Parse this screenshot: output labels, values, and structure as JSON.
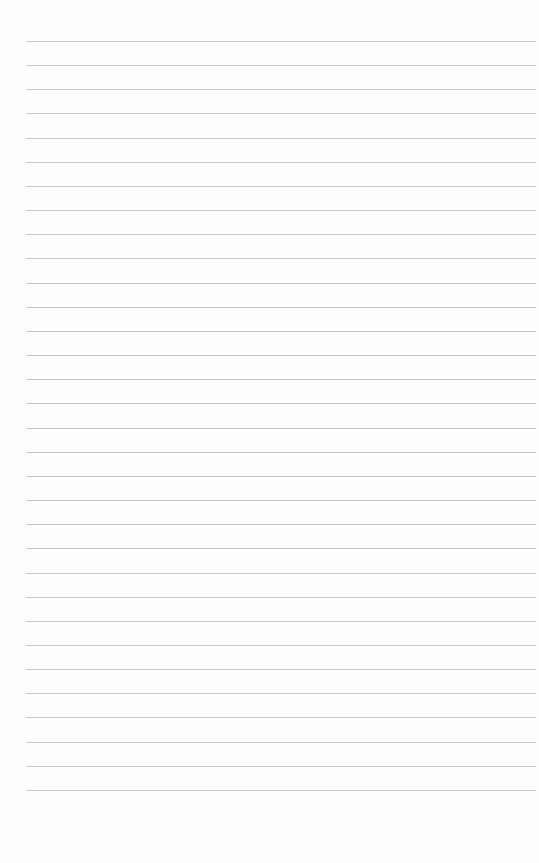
{
  "page": {
    "type": "lined-paper",
    "background_color": "#fefefe",
    "rule_color": "#c9c9c9",
    "rule_count": 32,
    "first_rule_y": 41,
    "rule_spacing": 24.16,
    "rule_left": 26,
    "rule_width": 510
  }
}
